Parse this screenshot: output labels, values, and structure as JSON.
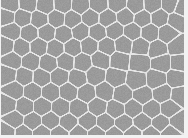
{
  "image": {
    "description": "Grayscale micrograph of polygonal cells with light boundaries (cell tessellation)",
    "width": 188,
    "height": 138,
    "colors": {
      "cell_fill": "#9a9a9a",
      "boundary": "#e6e6e6",
      "margin": "#f2f2f2"
    },
    "region": {
      "x": 1,
      "y": 0,
      "w": 183,
      "h": 135
    },
    "seeds": [
      [
        9,
        4
      ],
      [
        26,
        3
      ],
      [
        44,
        5
      ],
      [
        61,
        4
      ],
      [
        79,
        5
      ],
      [
        97,
        4
      ],
      [
        116,
        3
      ],
      [
        134,
        5
      ],
      [
        151,
        4
      ],
      [
        169,
        4
      ],
      [
        180,
        8
      ],
      [
        5,
        16
      ],
      [
        21,
        17
      ],
      [
        38,
        19
      ],
      [
        55,
        18
      ],
      [
        71,
        19
      ],
      [
        89,
        17
      ],
      [
        106,
        18
      ],
      [
        124,
        16
      ],
      [
        141,
        18
      ],
      [
        158,
        17
      ],
      [
        175,
        20
      ],
      [
        10,
        31
      ],
      [
        28,
        33
      ],
      [
        45,
        32
      ],
      [
        62,
        34
      ],
      [
        79,
        31
      ],
      [
        96,
        32
      ],
      [
        113,
        30
      ],
      [
        131,
        31
      ],
      [
        148,
        32
      ],
      [
        166,
        33
      ],
      [
        4,
        45
      ],
      [
        20,
        47
      ],
      [
        37,
        46
      ],
      [
        54,
        48
      ],
      [
        71,
        47
      ],
      [
        88,
        45
      ],
      [
        105,
        46
      ],
      [
        122,
        44
      ],
      [
        139,
        46
      ],
      [
        156,
        49
      ],
      [
        176,
        46
      ],
      [
        11,
        60
      ],
      [
        29,
        61
      ],
      [
        47,
        63
      ],
      [
        64,
        61
      ],
      [
        81,
        62
      ],
      [
        99,
        59
      ],
      [
        118,
        60
      ],
      [
        138,
        62
      ],
      [
        160,
        62
      ],
      [
        178,
        62
      ],
      [
        6,
        74
      ],
      [
        23,
        76
      ],
      [
        40,
        77
      ],
      [
        58,
        76
      ],
      [
        76,
        78
      ],
      [
        94,
        75
      ],
      [
        114,
        77
      ],
      [
        135,
        80
      ],
      [
        155,
        79
      ],
      [
        175,
        78
      ],
      [
        13,
        90
      ],
      [
        31,
        91
      ],
      [
        49,
        92
      ],
      [
        67,
        91
      ],
      [
        85,
        93
      ],
      [
        103,
        91
      ],
      [
        121,
        94
      ],
      [
        141,
        95
      ],
      [
        161,
        93
      ],
      [
        178,
        95
      ],
      [
        6,
        104
      ],
      [
        23,
        106
      ],
      [
        41,
        106
      ],
      [
        59,
        107
      ],
      [
        77,
        108
      ],
      [
        96,
        106
      ],
      [
        114,
        109
      ],
      [
        132,
        108
      ],
      [
        150,
        109
      ],
      [
        168,
        108
      ],
      [
        13,
        119
      ],
      [
        31,
        121
      ],
      [
        49,
        120
      ],
      [
        67,
        122
      ],
      [
        86,
        121
      ],
      [
        104,
        122
      ],
      [
        122,
        123
      ],
      [
        141,
        121
      ],
      [
        159,
        123
      ],
      [
        177,
        121
      ],
      [
        5,
        132
      ],
      [
        22,
        133
      ],
      [
        40,
        133
      ],
      [
        58,
        134
      ],
      [
        77,
        133
      ],
      [
        95,
        134
      ],
      [
        113,
        134
      ],
      [
        131,
        134
      ],
      [
        150,
        134
      ],
      [
        168,
        133
      ]
    ]
  }
}
